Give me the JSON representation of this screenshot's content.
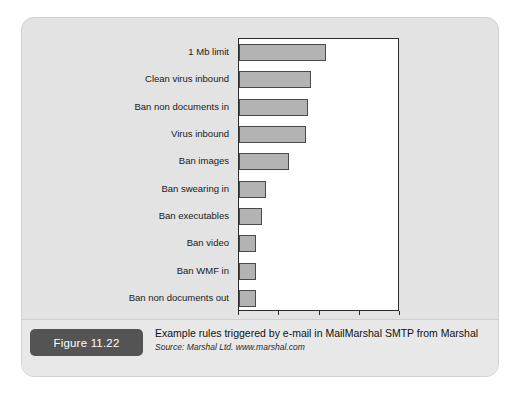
{
  "figure": {
    "badge_label": "Figure 11.22",
    "caption_title": "Example rules triggered by e-mail in MailMarshal SMTP from Marshal",
    "caption_source": "Source: Marshal Ltd. www.marshal.com"
  },
  "chart_data": {
    "type": "bar",
    "orientation": "horizontal",
    "title": "",
    "xlabel": "Number of messages",
    "ylabel": "",
    "xlim": [
      0,
      800
    ],
    "xticks": [
      0,
      200,
      400,
      600,
      800
    ],
    "grid": false,
    "legend": "none",
    "categories": [
      "1 Mb limit",
      "Clean virus inbound",
      "Ban non documents in",
      "Virus inbound",
      "Ban images",
      "Ban swearing in",
      "Ban executables",
      "Ban video",
      "Ban WMF in",
      "Ban non documents out"
    ],
    "values": [
      430,
      360,
      345,
      335,
      250,
      135,
      115,
      85,
      85,
      85
    ],
    "bar_fill": "#b3b3b3",
    "bar_edge": "#4a4a4a",
    "plot_background": "#ffffff",
    "panel_background": "#e3e3e3"
  }
}
